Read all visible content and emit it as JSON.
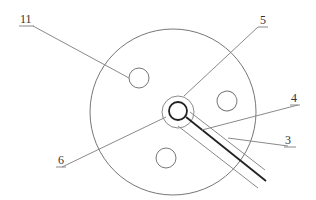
{
  "diagram": {
    "type": "technical-cross-section",
    "labels": [
      {
        "id": "11",
        "text": "11"
      },
      {
        "id": "5",
        "text": "5"
      },
      {
        "id": "4",
        "text": "4"
      },
      {
        "id": "3",
        "text": "3"
      },
      {
        "id": "6",
        "text": "6"
      }
    ],
    "colors": {
      "line": "#8a8a8a",
      "dark_line": "#222222",
      "text": "#333333",
      "background": "#ffffff"
    }
  }
}
